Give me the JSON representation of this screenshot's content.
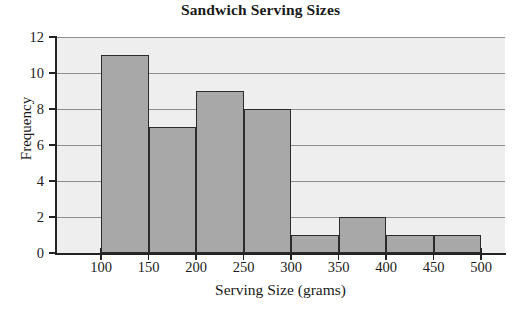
{
  "chart_data": {
    "type": "bar",
    "title": "Sandwich Serving Sizes",
    "xlabel": "Serving Size (grams)",
    "ylabel": "Frequency",
    "grid": true,
    "legend": false,
    "xlim": [
      75,
      525
    ],
    "ylim": [
      0,
      12
    ],
    "bin_width": 50,
    "x_ticks": [
      100,
      150,
      200,
      250,
      300,
      350,
      400,
      450,
      500
    ],
    "x_tick_labels": [
      "100",
      "150",
      "200",
      "250",
      "300",
      "350",
      "400",
      "450",
      "500"
    ],
    "y_ticks": [
      0,
      2,
      4,
      6,
      8,
      10,
      12
    ],
    "y_tick_labels": [
      "0",
      "2",
      "4",
      "6",
      "8",
      "10",
      "12"
    ],
    "bin_edges": [
      100,
      150,
      200,
      250,
      300,
      350,
      400,
      450,
      500
    ],
    "categories": [
      "100-150",
      "150-200",
      "200-250",
      "250-300",
      "300-350",
      "350-400",
      "400-450",
      "450-500"
    ],
    "values": [
      11,
      7,
      9,
      8,
      1,
      2,
      1,
      1
    ],
    "bars": [
      {
        "label": "100-150",
        "start": 100,
        "end": 150,
        "value": 11
      },
      {
        "label": "150-200",
        "start": 150,
        "end": 200,
        "value": 7
      },
      {
        "label": "200-250",
        "start": 200,
        "end": 250,
        "value": 9
      },
      {
        "label": "250-300",
        "start": 250,
        "end": 300,
        "value": 8
      },
      {
        "label": "300-350",
        "start": 300,
        "end": 350,
        "value": 1
      },
      {
        "label": "350-400",
        "start": 350,
        "end": 400,
        "value": 2
      },
      {
        "label": "400-450",
        "start": 400,
        "end": 450,
        "value": 1
      },
      {
        "label": "450-500",
        "start": 450,
        "end": 500,
        "value": 1
      }
    ],
    "colors": {
      "bar_fill": "#a8a8a8",
      "bar_edge": "#2b2b2b",
      "plot_background": "#eeeeee",
      "gridline": "#8e8e8e",
      "axis": "#232323",
      "text": "#1a1a1a",
      "figure_background": "#ffffff"
    }
  }
}
